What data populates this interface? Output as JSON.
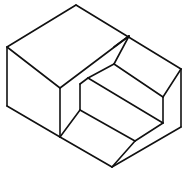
{
  "figure": {
    "type": "isometric-line-drawing",
    "stroke_color": "#111111",
    "background_color": "#ffffff",
    "caption": ""
  },
  "edges": [
    {
      "name": "top-left-edge",
      "x1": 7,
      "y1": 47,
      "x2": 76,
      "y2": 5
    },
    {
      "name": "top-right-edge",
      "x1": 76,
      "y1": 5,
      "x2": 181,
      "y2": 69
    },
    {
      "name": "left-vertical-edge",
      "x1": 7,
      "y1": 47,
      "x2": 7,
      "y2": 106
    },
    {
      "name": "top-front-edge",
      "x1": 7,
      "y1": 47,
      "x2": 60,
      "y2": 88
    },
    {
      "name": "front-vertical-edge",
      "x1": 60,
      "y1": 88,
      "x2": 60,
      "y2": 137
    },
    {
      "name": "bottom-left-edge",
      "x1": 7,
      "y1": 106,
      "x2": 60,
      "y2": 137
    },
    {
      "name": "bottom-front-edge",
      "x1": 60,
      "y1": 137,
      "x2": 112,
      "y2": 167
    },
    {
      "name": "right-vertical-edge",
      "x1": 181,
      "y1": 69,
      "x2": 181,
      "y2": 127
    },
    {
      "name": "bottom-right-edge",
      "x1": 112,
      "y1": 167,
      "x2": 181,
      "y2": 127
    },
    {
      "name": "notch-top-edge",
      "x1": 60,
      "y1": 88,
      "x2": 129,
      "y2": 36
    },
    {
      "name": "notch-diagonal-1",
      "x1": 129,
      "y1": 36,
      "x2": 114,
      "y2": 47
    },
    {
      "name": "notch-diagonal-2",
      "x1": 129,
      "y1": 36,
      "x2": 114,
      "y2": 64
    },
    {
      "name": "step-upper-tread",
      "x1": 114,
      "y1": 64,
      "x2": 88,
      "y2": 78
    },
    {
      "name": "step-upper-long",
      "x1": 114,
      "y1": 64,
      "x2": 163,
      "y2": 97
    },
    {
      "name": "step-upper-corner",
      "x1": 88,
      "y1": 78,
      "x2": 80,
      "y2": 84
    },
    {
      "name": "step-riser-left",
      "x1": 80,
      "y1": 84,
      "x2": 80,
      "y2": 110
    },
    {
      "name": "step-inner-diagonal",
      "x1": 80,
      "y1": 110,
      "x2": 60,
      "y2": 137
    },
    {
      "name": "step-middle-long-a",
      "x1": 88,
      "y1": 78,
      "x2": 163,
      "y2": 123
    },
    {
      "name": "step-middle-long-b",
      "x1": 80,
      "y1": 110,
      "x2": 135,
      "y2": 141
    },
    {
      "name": "step-right-riser",
      "x1": 163,
      "y1": 97,
      "x2": 163,
      "y2": 123
    },
    {
      "name": "step-right-upper",
      "x1": 163,
      "y1": 97,
      "x2": 181,
      "y2": 69
    },
    {
      "name": "step-right-lower",
      "x1": 163,
      "y1": 123,
      "x2": 135,
      "y2": 141
    },
    {
      "name": "step-bottom-diagonal",
      "x1": 135,
      "y1": 141,
      "x2": 112,
      "y2": 167
    }
  ]
}
